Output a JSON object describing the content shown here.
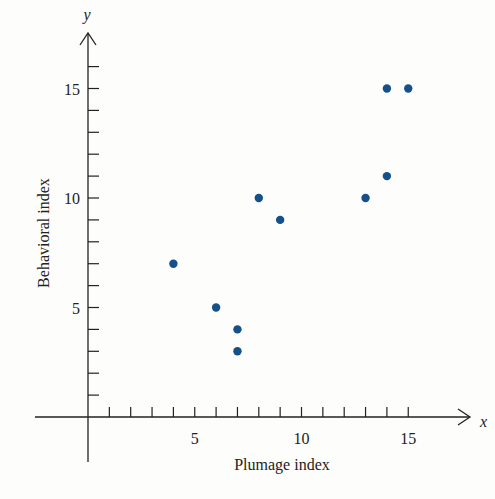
{
  "chart_data": {
    "type": "scatter",
    "title": "",
    "xlabel": "Plumage index",
    "ylabel": "Behavioral index",
    "x_axis_var": "x",
    "y_axis_var": "y",
    "xlim": [
      0,
      17
    ],
    "ylim": [
      0,
      17
    ],
    "x_ticks_major": [
      5,
      10,
      15
    ],
    "y_ticks_major": [
      5,
      10,
      15
    ],
    "x_minor_tick_step": 1,
    "y_minor_tick_step": 1,
    "grid": false,
    "legend": null,
    "marker_color": "#14508a",
    "points": [
      {
        "x": 4,
        "y": 7
      },
      {
        "x": 6,
        "y": 5
      },
      {
        "x": 7,
        "y": 4
      },
      {
        "x": 7,
        "y": 3
      },
      {
        "x": 8,
        "y": 10
      },
      {
        "x": 9,
        "y": 9
      },
      {
        "x": 13,
        "y": 10
      },
      {
        "x": 14,
        "y": 11
      },
      {
        "x": 14,
        "y": 15
      },
      {
        "x": 15,
        "y": 15
      }
    ]
  },
  "labels": {
    "x_title": "Plumage index",
    "y_title": "Behavioral index",
    "x_var": "x",
    "y_var": "y"
  }
}
